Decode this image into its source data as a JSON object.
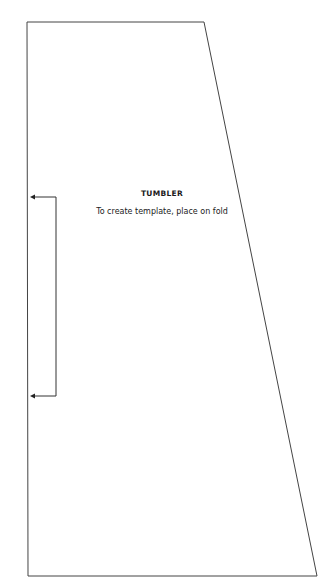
{
  "template": {
    "title": "TUMBLER",
    "instruction": "To create template, place on fold",
    "outline_color": "#444444",
    "shape": {
      "top_left": [
        27,
        22
      ],
      "top_right": [
        204,
        22
      ],
      "bottom_right": [
        317,
        576
      ],
      "bottom_left": [
        28,
        576
      ]
    },
    "fold_indicator": {
      "top_y": 197,
      "bottom_y": 396,
      "bracket_x": 56,
      "arrow_tip_x": 30
    }
  }
}
